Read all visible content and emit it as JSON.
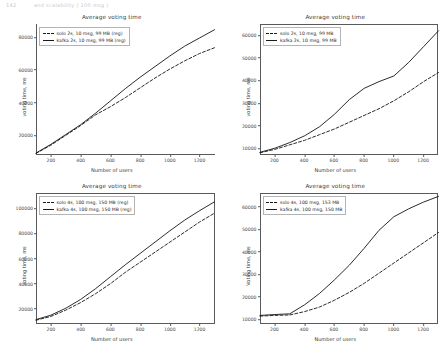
{
  "page_header": {
    "number": "142",
    "text": "and scalability ( 100 msg )"
  },
  "axis": {
    "xlabel": "Number of users",
    "ylabel": "Voting time, ms"
  },
  "chart_data": [
    {
      "id": "top-left",
      "type": "line",
      "title": "Average voting time",
      "xlabel": "Number of users",
      "ylabel": "voting time, ms",
      "xlim": [
        100,
        1300
      ],
      "ylim": [
        8000,
        88000
      ],
      "xticks": [
        200,
        400,
        600,
        800,
        1000,
        1200
      ],
      "yticks": [
        20000,
        40000,
        60000,
        80000
      ],
      "grid": false,
      "legend_position": "upper left",
      "x": [
        100,
        200,
        300,
        400,
        500,
        600,
        700,
        800,
        900,
        1000,
        1100,
        1200,
        1300
      ],
      "series": [
        {
          "name": "solo 2s, 10 msg, 99 MB (reg)",
          "style": "dashed",
          "values": [
            9000,
            14000,
            20000,
            26000,
            32500,
            37500,
            43000,
            49000,
            55000,
            60500,
            65500,
            70000,
            73500
          ]
        },
        {
          "name": "kafka 2s, 10 msg, 99 MB (reg)",
          "style": "solid",
          "values": [
            9200,
            14500,
            20500,
            26500,
            33500,
            41000,
            48500,
            55500,
            62000,
            68500,
            74500,
            79500,
            84500
          ]
        }
      ]
    },
    {
      "id": "top-right",
      "type": "line",
      "title": "Average voting time",
      "xlabel": "Number of users",
      "ylabel": "voting time, ms",
      "xlim": [
        100,
        1300
      ],
      "ylim": [
        7000,
        65000
      ],
      "xticks": [
        200,
        400,
        600,
        800,
        1000,
        1200
      ],
      "yticks": [
        10000,
        20000,
        30000,
        40000,
        50000,
        60000
      ],
      "grid": false,
      "legend_position": "upper left",
      "x": [
        100,
        200,
        300,
        400,
        500,
        600,
        700,
        800,
        900,
        1000,
        1100,
        1200,
        1300
      ],
      "series": [
        {
          "name": "solo 2s, 10 msg, 99 MB",
          "style": "dashed",
          "values": [
            8000,
            9500,
            11500,
            13500,
            16000,
            18500,
            21500,
            24500,
            27500,
            31000,
            35000,
            39500,
            43500
          ]
        },
        {
          "name": "kafka 2s, 10 msg, 99 MB",
          "style": "solid",
          "values": [
            8200,
            10000,
            12500,
            15500,
            19500,
            25000,
            31500,
            36500,
            39500,
            42000,
            48000,
            55000,
            62000
          ]
        }
      ]
    },
    {
      "id": "bottom-left",
      "type": "line",
      "title": "Average voting time",
      "xlabel": "Number of users",
      "ylabel": "voting time, ms",
      "xlim": [
        100,
        1300
      ],
      "ylim": [
        8000,
        112000
      ],
      "xticks": [
        200,
        400,
        600,
        800,
        1000,
        1200
      ],
      "yticks": [
        20000,
        40000,
        60000,
        80000,
        100000
      ],
      "grid": false,
      "legend_position": "upper left",
      "x": [
        100,
        200,
        300,
        400,
        500,
        600,
        700,
        800,
        900,
        1000,
        1100,
        1200,
        1300
      ],
      "series": [
        {
          "name": "solo 4s, 100 msg, 150 MB (reg)",
          "style": "dashed",
          "values": [
            11000,
            14000,
            19000,
            25000,
            32000,
            40000,
            49000,
            57000,
            65000,
            73000,
            81000,
            89000,
            96000
          ]
        },
        {
          "name": "kafka 4s, 100 msg, 150 MB (reg)",
          "style": "solid",
          "values": [
            11500,
            15000,
            20500,
            27500,
            36000,
            45500,
            55000,
            64000,
            73000,
            82000,
            90500,
            98000,
            105000
          ]
        }
      ]
    },
    {
      "id": "bottom-right",
      "type": "line",
      "title": "Average voting time",
      "xlabel": "Number of users",
      "ylabel": "Voting time, ms",
      "xlim": [
        100,
        1300
      ],
      "ylim": [
        8000,
        66000
      ],
      "xticks": [
        200,
        400,
        600,
        800,
        1000,
        1200
      ],
      "yticks": [
        10000,
        20000,
        30000,
        40000,
        50000,
        60000
      ],
      "grid": false,
      "legend_position": "upper left",
      "x": [
        100,
        200,
        300,
        400,
        500,
        600,
        700,
        800,
        900,
        1000,
        1100,
        1200,
        1300
      ],
      "series": [
        {
          "name": "solo 4s, 100 msg, 153 MB",
          "style": "dashed",
          "values": [
            11500,
            11800,
            12000,
            13500,
            15500,
            18500,
            22000,
            26000,
            30500,
            35000,
            39500,
            44000,
            48500
          ]
        },
        {
          "name": "kafka 4s, 100 msg, 150 MB",
          "style": "solid",
          "values": [
            11800,
            12200,
            12500,
            16500,
            21500,
            27500,
            34000,
            41500,
            49500,
            55500,
            59000,
            62000,
            64500
          ]
        }
      ]
    }
  ]
}
